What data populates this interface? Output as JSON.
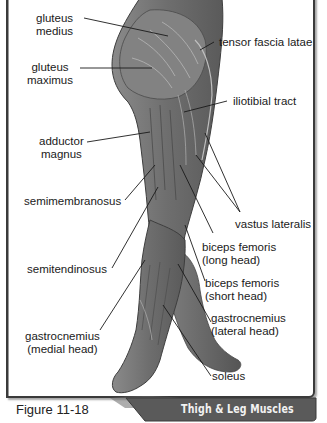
{
  "figure": {
    "caption": "Figure 11-18",
    "title": "Thigh & Leg Muscles"
  },
  "labels": {
    "gluteus_medius": [
      "gluteus",
      "medius"
    ],
    "gluteus_maximus": [
      "gluteus",
      "maximus"
    ],
    "adductor_magnus": [
      "adductor",
      "magnus"
    ],
    "semimembranosus": "semimembranosus",
    "semitendinosus": "semitendinosus",
    "gastrocnemius_medial": [
      "gastrocnemius",
      "(medial head)"
    ],
    "tensor_fascia_latae": "tensor fascia latae",
    "iliotibial_tract": "iliotibial tract",
    "vastus_lateralis": "vastus lateralis",
    "biceps_femoris_long": [
      "biceps femoris",
      "(long head)"
    ],
    "biceps_femoris_short": [
      "biceps femoris",
      "(short head)"
    ],
    "gastrocnemius_lateral": [
      "gastrocnemius",
      "(lateral head)"
    ],
    "soleus": "soleus"
  },
  "colors": {
    "frame": "#3a3a3a",
    "title_bar": "#5a5a5a",
    "title_text": "#f2f2f2",
    "leg_dark": "#555555",
    "leg_mid": "#7a7a7a",
    "leg_light": "#a0a0a0"
  }
}
